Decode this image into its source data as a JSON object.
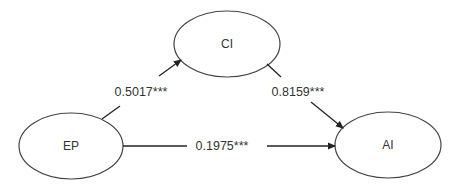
{
  "diagram": {
    "type": "path-model",
    "nodes": [
      {
        "id": "CI",
        "label": "CI"
      },
      {
        "id": "EP",
        "label": "EP"
      },
      {
        "id": "AI",
        "label": "AI"
      }
    ],
    "edges": [
      {
        "from": "EP",
        "to": "CI",
        "label": "0.5017***"
      },
      {
        "from": "CI",
        "to": "AI",
        "label": "0.8159***"
      },
      {
        "from": "EP",
        "to": "AI",
        "label": "0.1975***"
      }
    ],
    "colors": {
      "stroke": "#333333",
      "background": "#ffffff"
    }
  }
}
